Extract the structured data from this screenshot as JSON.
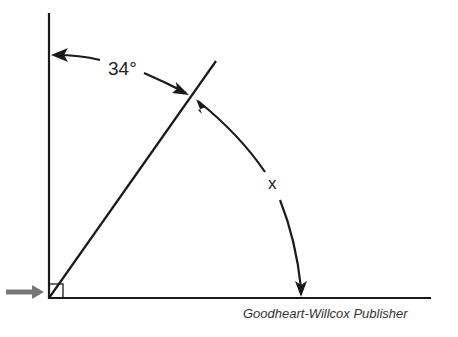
{
  "diagram": {
    "angle_label": "34°",
    "unknown_label": "x",
    "credit": "Goodheart-Willcox Publisher",
    "colors": {
      "line": "#1a1a1a",
      "pointer_arrow": "#777777"
    }
  }
}
